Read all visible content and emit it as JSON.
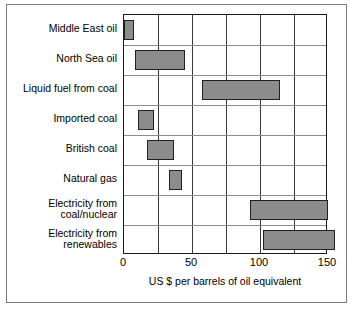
{
  "chart_data": {
    "type": "bar",
    "orientation": "horizontal",
    "bar_style": "range",
    "title": "",
    "xlabel": "US $ per barrels of oil equivalent",
    "ylabel": "",
    "xlim": [
      0,
      150
    ],
    "xticks": [
      0,
      50,
      100,
      150
    ],
    "xtick_labels": [
      "0",
      "50",
      "100",
      "150"
    ],
    "gridlines_x": [
      0,
      25,
      50,
      75,
      100,
      125,
      150
    ],
    "grid": true,
    "legend": "none",
    "bar_color": "#8c8c8c",
    "bar_edge_color": "#202020",
    "categories": [
      "Middle East oil",
      "North Sea oil",
      "Liquid fuel from coal",
      "Imported coal",
      "British coal",
      "Natural gas",
      "Electricity from\ncoal/nuclear",
      "Electricity from\nrenewables"
    ],
    "ranges": [
      {
        "label": "Middle East oil",
        "low": 0,
        "high": 7
      },
      {
        "label": "North Sea oil",
        "low": 8,
        "high": 45
      },
      {
        "label": "Liquid fuel from coal",
        "low": 57,
        "high": 115
      },
      {
        "label": "Imported coal",
        "low": 10,
        "high": 22
      },
      {
        "label": "British coal",
        "low": 17,
        "high": 37
      },
      {
        "label": "Natural gas",
        "low": 33,
        "high": 43
      },
      {
        "label": "Electricity from coal/nuclear",
        "low": 93,
        "high": 150
      },
      {
        "label": "Electricity from renewables",
        "low": 102,
        "high": 155
      }
    ]
  }
}
